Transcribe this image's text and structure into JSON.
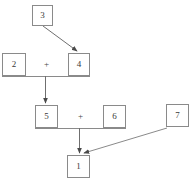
{
  "diagram": {
    "type": "expression-tree",
    "canvas": {
      "width": 192,
      "height": 192,
      "background": "#ffffff"
    },
    "line_color": "#8a8a8a",
    "text_color": "#3a3a3a",
    "nodes": [
      {
        "id": "n3",
        "label": "3",
        "x": 32,
        "y": 5,
        "w": 21,
        "h": 21
      },
      {
        "id": "n2",
        "label": "2",
        "x": 2,
        "y": 53,
        "w": 24,
        "h": 23
      },
      {
        "id": "n4",
        "label": "4",
        "x": 68,
        "y": 53,
        "w": 22,
        "h": 23
      },
      {
        "id": "n5",
        "label": "5",
        "x": 35,
        "y": 105,
        "w": 23,
        "h": 23
      },
      {
        "id": "n6",
        "label": "6",
        "x": 103,
        "y": 105,
        "w": 23,
        "h": 23
      },
      {
        "id": "n7",
        "label": "7",
        "x": 166,
        "y": 104,
        "w": 23,
        "h": 23
      },
      {
        "id": "n1",
        "label": "1",
        "x": 67,
        "y": 155,
        "w": 23,
        "h": 23
      }
    ],
    "operators": [
      {
        "id": "op-top",
        "label": "+",
        "x": 41,
        "y": 60
      },
      {
        "id": "op-mid",
        "label": "+",
        "x": 75,
        "y": 112
      }
    ],
    "connectors": [
      {
        "id": "join-top",
        "kind": "horizontal",
        "x1": 2,
        "x2": 90,
        "y": 76
      },
      {
        "id": "join-mid",
        "kind": "horizontal",
        "x1": 35,
        "x2": 126,
        "y": 128
      },
      {
        "id": "stem-top-to-5",
        "kind": "vertical-arrow",
        "x": 45,
        "y1": 76,
        "y2": 104
      },
      {
        "id": "stem-mid-to-1",
        "kind": "vertical-arrow",
        "x": 79,
        "y1": 128,
        "y2": 154
      }
    ],
    "arrows": [
      {
        "id": "arrow-3-to-4",
        "from": "n3",
        "to": "n4",
        "x1": 43,
        "y1": 26,
        "x2": 78,
        "y2": 52
      },
      {
        "id": "arrow-7-to-1",
        "from": "n7",
        "to": "n1",
        "x1": 167,
        "y1": 128,
        "x2": 83,
        "y2": 154
      }
    ]
  }
}
